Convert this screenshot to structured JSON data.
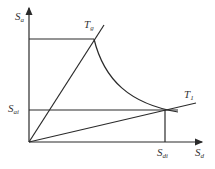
{
  "diagram": {
    "colors": {
      "line": "#2a2a2a",
      "background": "#ffffff"
    },
    "axes": {
      "y_label": {
        "main": "S",
        "sub": "a"
      },
      "x_label": {
        "main": "S",
        "sub": "d"
      }
    },
    "lines": {
      "steep": {
        "label_main": "T",
        "label_sub": "g"
      },
      "shallow": {
        "label_main": "T",
        "label_sub": "1"
      }
    },
    "markers": {
      "y_marker": {
        "main": "S",
        "sub": "ai"
      },
      "x_marker": {
        "main": "S",
        "sub": "di"
      }
    }
  }
}
